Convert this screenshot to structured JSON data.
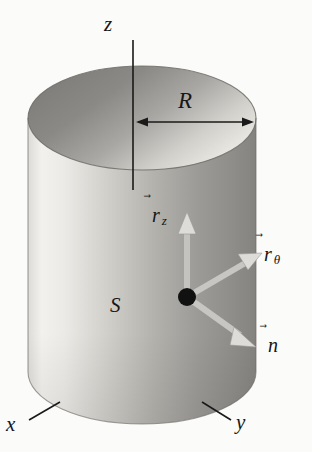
{
  "figure": {
    "background_color": "#fbfbfa",
    "labels": {
      "z_axis": "z",
      "radius": "R",
      "surface": "S",
      "x_axis": "x",
      "y_axis": "y"
    },
    "vectors": [
      {
        "name": "r-z-vector",
        "arrow_glyph": "⃗",
        "base": "r",
        "subscript": "z",
        "direction": "up",
        "color": "#d4d4d4"
      },
      {
        "name": "r-theta-vector",
        "arrow_glyph": "⃗",
        "base": "r",
        "subscript": "θ",
        "direction": "upper-right",
        "color": "#d4d4d4"
      },
      {
        "name": "n-vector",
        "arrow_glyph": "⃗",
        "base": "n",
        "subscript": "",
        "direction": "lower-right",
        "color": "#d4d4d4"
      }
    ],
    "geometry": {
      "cylinder_body_light": "#f2f2f0",
      "cylinder_body_mid": "#b8b8b4",
      "cylinder_body_dark": "#8e8e8a",
      "top_ellipse_dark": "#868682",
      "top_ellipse_light": "#e6e6e2",
      "outline_color": "#6f6f6b",
      "axis_line_color": "#1a1a1a",
      "point_color": "#111111"
    }
  }
}
